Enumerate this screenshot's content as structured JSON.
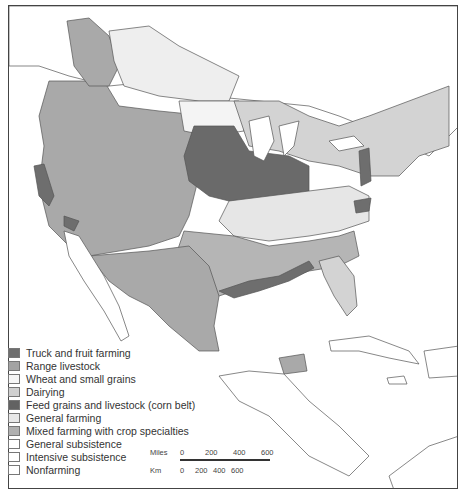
{
  "map": {
    "region": "North America agricultural regions (United States, southern Canada, Mexico, Central America, Caribbean)",
    "colors": {
      "truck_fruit": "#6e6e6e",
      "range_livestock": "#a9a9a9",
      "wheat_grains": "#f4f4f4",
      "dairying": "#d3d3d3",
      "corn_belt": "#6a6a6a",
      "general_farming": "#e6e6e6",
      "mixed_farming": "#b5b5b5",
      "general_subsistence": "#ffffff",
      "intensive_subsistence": "#ffffff",
      "nonfarming": "#ffffff",
      "water": "#ffffff",
      "border": "#555555"
    }
  },
  "legend": {
    "items": [
      {
        "label": "Truck and fruit farming",
        "color": "#6e6e6e"
      },
      {
        "label": "Range livestock",
        "color": "#a3a3a3"
      },
      {
        "label": "Wheat and small grains",
        "color": "#f6f6f6"
      },
      {
        "label": "Dairying",
        "color": "#d0d0d0"
      },
      {
        "label": "Feed grains and livestock (corn belt)",
        "color": "#626262"
      },
      {
        "label": "General farming",
        "color": "#e8e8e8"
      },
      {
        "label": "Mixed farming with crop specialties",
        "color": "#b0b0b0"
      },
      {
        "label": "General subsistence",
        "color": "#ffffff"
      },
      {
        "label": "Intensive subsistence",
        "color": "#ffffff"
      },
      {
        "label": "Nonfarming",
        "color": "#ffffff"
      }
    ]
  },
  "scale_bar": {
    "miles_label": "Miles",
    "miles_ticks": [
      "0",
      "200",
      "400",
      "600"
    ],
    "km_label": "Km",
    "km_ticks": [
      "0",
      "200",
      "400",
      "600"
    ]
  }
}
